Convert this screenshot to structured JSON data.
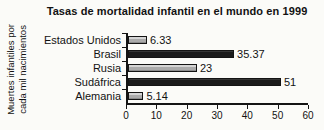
{
  "title": "Tasas de mortalidad infantil en el mundo en 1999",
  "y_axis_label_lines": [
    "Muertes infantiles por",
    "cada mil nacimientos"
  ],
  "chart_data": {
    "type": "bar",
    "orientation": "horizontal",
    "title": "Tasas de mortalidad infantil en el mundo en 1999",
    "ylabel": "Muertes infantiles por cada mil nacimientos",
    "xlabel": "",
    "categories": [
      "Estados Unidos",
      "Brasil",
      "Rusia",
      "Sudáfrica",
      "Alemania"
    ],
    "values": [
      6.33,
      35.37,
      23,
      51,
      5.14
    ],
    "value_labels": [
      "6.33",
      "35.37",
      "23",
      "51",
      "5.14"
    ],
    "bar_styles": [
      "light",
      "dark",
      "light",
      "dark",
      "light"
    ],
    "bar_colors": [
      "#ababab",
      "#1b1b1b",
      "#ababab",
      "#1b1b1b",
      "#ababab"
    ],
    "xlim": [
      0,
      60
    ],
    "x_ticks": [
      0,
      10,
      20,
      30,
      40,
      50,
      60
    ],
    "grid": false,
    "legend": "none"
  },
  "colors": {
    "background": "#fbfbf8",
    "axis": "#141414",
    "text": "#121212",
    "bar_light": "#ababab",
    "bar_dark": "#1b1b1b"
  }
}
